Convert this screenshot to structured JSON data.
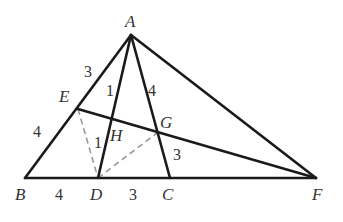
{
  "diagram": {
    "type": "geometry-triangle",
    "points": {
      "A": {
        "label": "A",
        "x": 131,
        "y": 35
      },
      "B": {
        "label": "B",
        "x": 25,
        "y": 178
      },
      "C": {
        "label": "C",
        "x": 170,
        "y": 178
      },
      "D": {
        "label": "D",
        "x": 98,
        "y": 178
      },
      "E": {
        "label": "E",
        "x": 78,
        "y": 109
      },
      "F": {
        "label": "F",
        "x": 316,
        "y": 178
      },
      "G": {
        "label": "G",
        "x": 157,
        "y": 133
      },
      "H": {
        "label": "H",
        "x": 112,
        "y": 120
      }
    },
    "solid_segments": [
      [
        "A",
        "B"
      ],
      [
        "A",
        "C"
      ],
      [
        "A",
        "D"
      ],
      [
        "A",
        "F"
      ],
      [
        "B",
        "F"
      ],
      [
        "E",
        "F"
      ]
    ],
    "dashed_segments": [
      [
        "E",
        "D"
      ],
      [
        "D",
        "G"
      ]
    ],
    "segment_labels": [
      {
        "id": "AE",
        "text": "3"
      },
      {
        "id": "EB",
        "text": "4"
      },
      {
        "id": "AH",
        "text": "1"
      },
      {
        "id": "HD",
        "text": "1"
      },
      {
        "id": "AG",
        "text": "4"
      },
      {
        "id": "GC",
        "text": "3"
      },
      {
        "id": "BD",
        "text": "4"
      },
      {
        "id": "DC",
        "text": "3"
      }
    ]
  }
}
